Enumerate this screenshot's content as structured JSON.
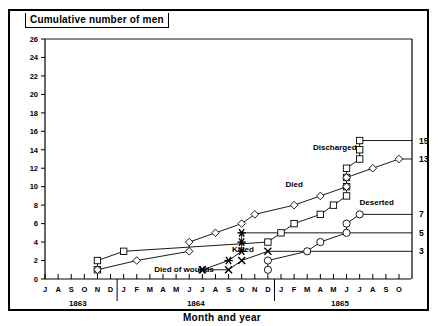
{
  "chart_data": {
    "type": "line",
    "title": "Cumulative number of men",
    "xlabel": "Month and year",
    "ylabel": "Cumulative number of men",
    "ylim": [
      0,
      26
    ],
    "yticks": [
      0,
      2,
      4,
      6,
      8,
      10,
      12,
      14,
      16,
      18,
      20,
      22,
      24,
      26
    ],
    "grid": false,
    "legend_position": "inline-labels",
    "x_months": [
      "J",
      "A",
      "S",
      "O",
      "N",
      "D",
      "J",
      "F",
      "M",
      "A",
      "M",
      "J",
      "J",
      "A",
      "S",
      "O",
      "N",
      "D",
      "J",
      "F",
      "M",
      "A",
      "M",
      "J",
      "J",
      "A",
      "S",
      "O"
    ],
    "year_labels": [
      {
        "label": "1863",
        "start_index": 0,
        "end_index": 5
      },
      {
        "label": "1864",
        "start_index": 6,
        "end_index": 17
      },
      {
        "label": "1865",
        "start_index": 18,
        "end_index": 27
      }
    ],
    "right_axis_labels": [
      "15",
      "13",
      "7",
      "5",
      "3"
    ],
    "right_axis_values": [
      15,
      13,
      7,
      5,
      3
    ],
    "series": [
      {
        "name": "Discharged",
        "marker": "square",
        "final_value": 15,
        "points": [
          {
            "x": 4,
            "y": 1
          },
          {
            "x": 4,
            "y": 2
          },
          {
            "x": 6,
            "y": 3
          },
          {
            "x": 17,
            "y": 4
          },
          {
            "x": 18,
            "y": 5
          },
          {
            "x": 19,
            "y": 6
          },
          {
            "x": 21,
            "y": 7
          },
          {
            "x": 22,
            "y": 8
          },
          {
            "x": 23,
            "y": 9
          },
          {
            "x": 23,
            "y": 10
          },
          {
            "x": 23,
            "y": 11
          },
          {
            "x": 23,
            "y": 12
          },
          {
            "x": 24,
            "y": 13
          },
          {
            "x": 24,
            "y": 14
          },
          {
            "x": 24,
            "y": 15
          }
        ]
      },
      {
        "name": "Died",
        "marker": "diamond",
        "final_value": 13,
        "points": [
          {
            "x": 4,
            "y": 1
          },
          {
            "x": 7,
            "y": 2
          },
          {
            "x": 11,
            "y": 3
          },
          {
            "x": 11,
            "y": 4
          },
          {
            "x": 13,
            "y": 5
          },
          {
            "x": 15,
            "y": 6
          },
          {
            "x": 16,
            "y": 7
          },
          {
            "x": 19,
            "y": 8
          },
          {
            "x": 21,
            "y": 9
          },
          {
            "x": 23,
            "y": 10
          },
          {
            "x": 23,
            "y": 11
          },
          {
            "x": 25,
            "y": 12
          },
          {
            "x": 27,
            "y": 13
          }
        ]
      },
      {
        "name": "Deserted",
        "marker": "circle",
        "final_value": 7,
        "points": [
          {
            "x": 17,
            "y": 1
          },
          {
            "x": 17,
            "y": 2
          },
          {
            "x": 20,
            "y": 3
          },
          {
            "x": 21,
            "y": 4
          },
          {
            "x": 23,
            "y": 5
          },
          {
            "x": 23,
            "y": 6
          },
          {
            "x": 24,
            "y": 7
          }
        ]
      },
      {
        "name": "Killed",
        "marker": "asterisk",
        "final_value": 5,
        "points": [
          {
            "x": 12,
            "y": 1
          },
          {
            "x": 14,
            "y": 2
          },
          {
            "x": 15,
            "y": 3
          },
          {
            "x": 15,
            "y": 4
          },
          {
            "x": 15,
            "y": 5
          }
        ]
      },
      {
        "name": "Died of wounds",
        "marker": "x",
        "final_value": 3,
        "points": [
          {
            "x": 12,
            "y": 1
          },
          {
            "x": 14,
            "y": 1
          },
          {
            "x": 15,
            "y": 2
          },
          {
            "x": 17,
            "y": 3
          }
        ]
      }
    ],
    "series_label_positions": [
      {
        "name": "Discharged",
        "x": 22.1,
        "y": 14.3
      },
      {
        "name": "Died",
        "x": 19.0,
        "y": 10.3
      },
      {
        "name": "Deserted",
        "x": 25.3,
        "y": 8.3
      },
      {
        "name": "Killed",
        "x": 15.1,
        "y": 3.3
      },
      {
        "name": "Died of wounds",
        "x": 10.6,
        "y": 1.05
      }
    ]
  }
}
